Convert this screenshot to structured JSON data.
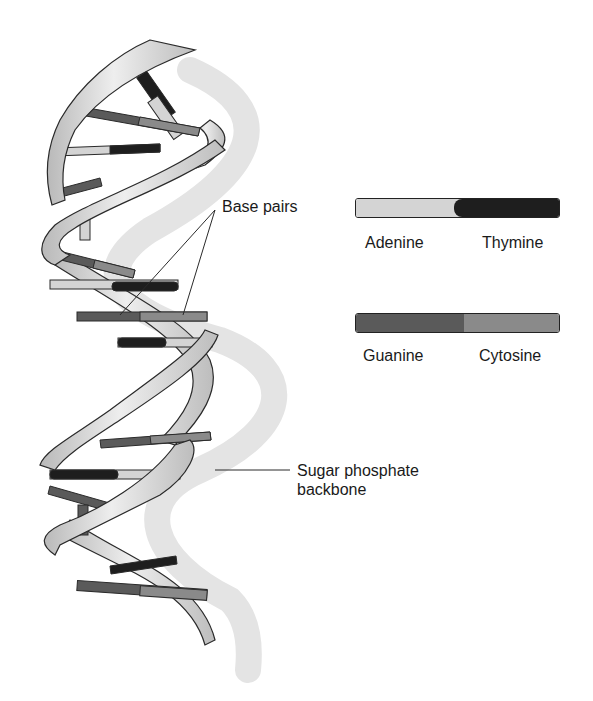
{
  "diagram": {
    "labels": {
      "base_pairs": "Base pairs",
      "backbone_line1": "Sugar phosphate",
      "backbone_line2": "backbone"
    },
    "legend": [
      {
        "left": "Adenine",
        "right": "Thymine",
        "left_color": "#d4d4d4",
        "right_color": "#1e1e1e"
      },
      {
        "left": "Guanine",
        "right": "Cytosine",
        "left_color": "#5a5a5a",
        "right_color": "#8a8a8a"
      }
    ],
    "colors": {
      "ribbon": "#cfcfcf",
      "ribbon_highlight": "#eeeeee",
      "shadow": "#e3e3e3",
      "outline": "#2a2a2a",
      "adenine": "#d4d4d4",
      "thymine": "#1e1e1e",
      "guanine": "#5a5a5a",
      "cytosine": "#8a8a8a"
    }
  }
}
